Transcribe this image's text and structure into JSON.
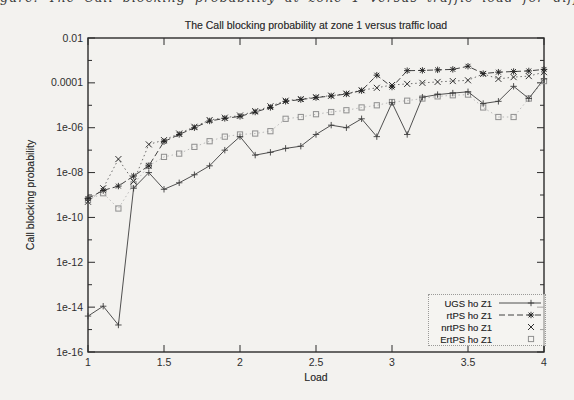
{
  "caption_fragment": "gure: The Call blocking probability at zone 1 versus traffic load for different traffic types",
  "chart_data": {
    "type": "line",
    "title": "The Call blocking probability at zone 1 versus traffic load",
    "xlabel": "Load",
    "ylabel": "Call blocking probability",
    "legend_position": "bottom-right",
    "grid": false,
    "x_axis": {
      "min": 1,
      "max": 4,
      "ticks": [
        1,
        1.5,
        2,
        2.5,
        3,
        3.5,
        4
      ],
      "tick_labels": [
        "1",
        "1.5",
        "2",
        "2.5",
        "3",
        "3.5",
        "4"
      ]
    },
    "y_axis": {
      "scale": "log",
      "min": 1e-16,
      "max": 0.01,
      "tick_values": [
        0.01,
        0.0001,
        1e-06,
        1e-08,
        1e-10,
        1e-12,
        1e-14,
        1e-16
      ],
      "tick_labels": [
        "0.01",
        "0.0001",
        "1e-06",
        "1e-08",
        "1e-10",
        "1e-12",
        "1e-14",
        "1e-16"
      ]
    },
    "x": [
      1.0,
      1.1,
      1.2,
      1.3,
      1.4,
      1.5,
      1.6,
      1.7,
      1.8,
      1.9,
      2.0,
      2.1,
      2.2,
      2.3,
      2.4,
      2.5,
      2.6,
      2.7,
      2.8,
      2.9,
      3.0,
      3.1,
      3.2,
      3.3,
      3.4,
      3.5,
      3.6,
      3.7,
      3.8,
      3.9,
      4.0
    ],
    "series": [
      {
        "name": "UGS ho Z1",
        "style": "solid",
        "marker": "plus",
        "values": [
          4e-15,
          1.1e-14,
          1.6e-15,
          2e-09,
          1e-08,
          1.8e-09,
          3.5e-09,
          8e-09,
          2e-08,
          1e-07,
          4e-07,
          6e-08,
          8e-08,
          1.2e-07,
          1.5e-07,
          5e-07,
          1.3e-06,
          1e-06,
          2.5e-06,
          4e-07,
          1.3e-05,
          5e-07,
          2.3e-05,
          3e-05,
          3.5e-05,
          4e-05,
          1.2e-05,
          1.5e-05,
          7e-05,
          2e-05,
          0.00015
        ]
      },
      {
        "name": "rtPS ho Z1",
        "style": "dashed",
        "marker": "asterisk",
        "values": [
          7e-10,
          1.6e-09,
          2.5e-09,
          7e-09,
          2e-08,
          2.4e-07,
          5e-07,
          1e-06,
          2e-06,
          2.6e-06,
          3.2e-06,
          5e-06,
          8e-06,
          1.5e-05,
          1.8e-05,
          2.2e-05,
          2.6e-05,
          3.2e-05,
          4.5e-05,
          0.00022,
          6.5e-05,
          0.00035,
          0.00036,
          0.00038,
          0.0004,
          0.00055,
          0.00026,
          0.0003,
          0.00032,
          0.00034,
          0.0004
        ]
      },
      {
        "name": "nrtPS ho Z1",
        "style": "dotted",
        "marker": "cross",
        "values": [
          5e-10,
          2e-09,
          4e-08,
          4e-09,
          1.8e-07,
          2.8e-07,
          5.5e-07,
          1.1e-06,
          2.2e-06,
          2.8e-06,
          3.5e-06,
          5.5e-06,
          9e-06,
          1.6e-05,
          1.9e-05,
          2.3e-05,
          2.7e-05,
          3.3e-05,
          4.7e-05,
          6e-05,
          8e-05,
          9e-05,
          0.0001,
          0.00011,
          0.00012,
          0.00013,
          0.00025,
          0.00015,
          0.00018,
          0.0002,
          0.0003
        ]
      },
      {
        "name": "ErtPS ho Z1",
        "style": "dotted-light",
        "marker": "square",
        "values": [
          6e-10,
          1.2e-09,
          2.5e-10,
          3e-09,
          2e-08,
          5e-08,
          7e-08,
          1.4e-07,
          2.5e-07,
          4e-07,
          5e-07,
          5.5e-07,
          7e-07,
          2.5e-06,
          3e-06,
          4e-06,
          5e-06,
          6e-06,
          8e-06,
          1e-05,
          1.4e-05,
          1.6e-05,
          2e-05,
          2.5e-05,
          2.8e-05,
          3e-05,
          8e-06,
          3e-06,
          3e-06,
          2e-05,
          0.00012
        ]
      }
    ]
  }
}
